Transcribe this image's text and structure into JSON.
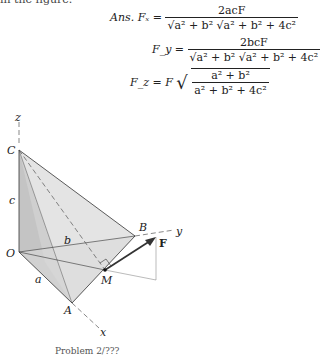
{
  "top_cut_text": "in the figure.",
  "answers": {
    "prefix": "Ans.",
    "fx": {
      "lhs": "Fₓ =",
      "num": "2acF",
      "den": "√a² + b² √a² + b² + 4c²"
    },
    "fy": {
      "lhs": "F_y =",
      "num": "2bcF",
      "den": "√a² + b² √a² + b² + 4c²"
    },
    "fz": {
      "lhs": "F_z = F",
      "num": "a² + b²",
      "den": "a² + b² + 4c²"
    }
  },
  "diagram": {
    "labels": {
      "z": "z",
      "C": "C",
      "c": "c",
      "O": "O",
      "b": "b",
      "B": "B",
      "y": "y",
      "F": "F",
      "M": "M",
      "a": "a",
      "A": "A",
      "x": "x"
    },
    "colors": {
      "face_light": "#e6e6e6",
      "face_mid": "#d2d2d2",
      "face_dark": "#bdbdbd",
      "edge": "#333333"
    }
  },
  "caption": "Problem 2/???"
}
